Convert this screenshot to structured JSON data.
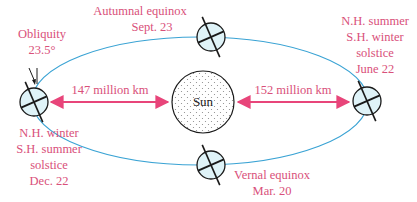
{
  "diagram": {
    "colors": {
      "label": "#d9507a",
      "arrow": "#e8457a",
      "orbit": "#3aa3d4",
      "earth_fill": "#dff3f8",
      "stroke": "#1a1a1a"
    },
    "sun": {
      "label": "Sun"
    },
    "obliquity": {
      "line1": "Obliquity",
      "line2": "23.5°"
    },
    "distances": {
      "perihelion": "147 million km",
      "aphelion": "152 million km"
    },
    "positions": {
      "autumnal": {
        "line1": "Autumnal equinox",
        "line2": "Sept. 23"
      },
      "vernal": {
        "line1": "Vernal equinox",
        "line2": "Mar. 20"
      },
      "june": {
        "line1": "N.H. summer",
        "line2": "S.H. winter",
        "line3": "solstice",
        "line4": "June 22"
      },
      "december": {
        "line1": "N.H. winter",
        "line2": "S.H. summer",
        "line3": "solstice",
        "line4": "Dec. 22"
      }
    }
  }
}
